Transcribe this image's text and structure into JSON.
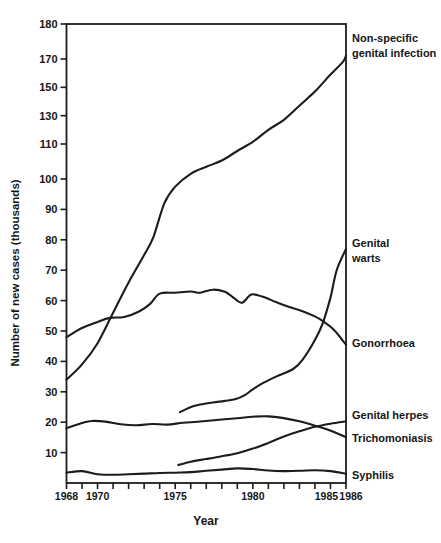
{
  "figure": {
    "background": "#ffffff",
    "line_color": "#1c1c1c",
    "text_color": "#161616"
  },
  "chart_data": {
    "type": "line",
    "title": "",
    "xlabel": "Year",
    "ylabel": "Number of new cases (thousands)",
    "x_range": [
      1968,
      1986
    ],
    "y_scale_note": "Scale compressed above 110: labeled ticks 110, 130, 150, 170, 180 drawn at equal spacing",
    "grid": "off",
    "frame": "full box",
    "y_ticks": [
      {
        "value": 180,
        "label": "180"
      },
      {
        "value": 170,
        "label": "170"
      },
      {
        "value": 150,
        "label": "150"
      },
      {
        "value": 130,
        "label": "130"
      },
      {
        "value": 110,
        "label": "110"
      },
      {
        "value": 100,
        "label": "100"
      },
      {
        "value": 90,
        "label": "90"
      },
      {
        "value": 80,
        "label": "80"
      },
      {
        "value": 70,
        "label": "70"
      },
      {
        "value": 60,
        "label": "60"
      },
      {
        "value": 50,
        "label": "50"
      },
      {
        "value": 40,
        "label": "40"
      },
      {
        "value": 30,
        "label": "30"
      },
      {
        "value": 20,
        "label": "20"
      },
      {
        "value": 10,
        "label": "10"
      }
    ],
    "x_ticks_years": [
      1968,
      1969,
      1970,
      1971,
      1972,
      1973,
      1974,
      1975,
      1976,
      1977,
      1978,
      1979,
      1980,
      1981,
      1982,
      1983,
      1984,
      1985,
      1986
    ],
    "x_tick_labels": [
      {
        "year": 1968,
        "label": "1968",
        "dx": 0
      },
      {
        "year": 1970,
        "label": "1970",
        "dx": 0
      },
      {
        "year": 1975,
        "label": "1975",
        "dx": 0
      },
      {
        "year": 1980,
        "label": "1980",
        "dx": 0
      },
      {
        "year": 1985,
        "label": "1985",
        "dx": -4
      },
      {
        "year": 1986,
        "label": "1986",
        "dx": 5
      }
    ],
    "series": [
      {
        "name": "Non-specific genital infection",
        "label_lines": [
          "Non-specific",
          "genital infection"
        ],
        "label_y": 42,
        "points": [
          [
            1968,
            34
          ],
          [
            1969,
            39
          ],
          [
            1970,
            46
          ],
          [
            1971,
            56
          ],
          [
            1972,
            66
          ],
          [
            1973,
            75
          ],
          [
            1973.6,
            81
          ],
          [
            1974.3,
            92
          ],
          [
            1975,
            97.5
          ],
          [
            1976,
            101.5
          ],
          [
            1977,
            103.5
          ],
          [
            1978,
            105.3
          ],
          [
            1979,
            108
          ],
          [
            1980,
            111.5
          ],
          [
            1981,
            120
          ],
          [
            1982,
            127
          ],
          [
            1983,
            137
          ],
          [
            1984,
            147
          ],
          [
            1984.5,
            153
          ],
          [
            1985,
            159
          ],
          [
            1985.8,
            168
          ],
          [
            1986,
            171
          ]
        ]
      },
      {
        "name": "Gonorrhoea",
        "label_lines": [
          "Gonorrhoea"
        ],
        "label_y": 347,
        "points": [
          [
            1968,
            48
          ],
          [
            1969,
            51
          ],
          [
            1970,
            53
          ],
          [
            1970.8,
            54.3
          ],
          [
            1971.7,
            54.6
          ],
          [
            1972.7,
            56.5
          ],
          [
            1973.4,
            59
          ],
          [
            1974,
            62.3
          ],
          [
            1975,
            62.6
          ],
          [
            1976,
            63
          ],
          [
            1976.6,
            62.6
          ],
          [
            1977.4,
            63.6
          ],
          [
            1978.2,
            62.9
          ],
          [
            1978.7,
            61.2
          ],
          [
            1979.3,
            59.3
          ],
          [
            1979.9,
            62
          ],
          [
            1980.6,
            61.3
          ],
          [
            1981.5,
            59.5
          ],
          [
            1982.4,
            57.8
          ],
          [
            1983.2,
            56.5
          ],
          [
            1984,
            54.8
          ],
          [
            1984.5,
            53.3
          ],
          [
            1985.2,
            50.5
          ],
          [
            1986,
            45.5
          ]
        ]
      },
      {
        "name": "Genital warts",
        "label_lines": [
          "Genital",
          "warts"
        ],
        "label_y": 247,
        "points": [
          [
            1975.3,
            23.3
          ],
          [
            1976.2,
            25.3
          ],
          [
            1977.2,
            26.3
          ],
          [
            1978.2,
            27
          ],
          [
            1978.9,
            27.6
          ],
          [
            1979.5,
            29
          ],
          [
            1980,
            30.8
          ],
          [
            1980.7,
            33
          ],
          [
            1981.5,
            35
          ],
          [
            1982.6,
            37.5
          ],
          [
            1983.2,
            40.5
          ],
          [
            1984,
            47
          ],
          [
            1984.5,
            52.5
          ],
          [
            1985,
            61
          ],
          [
            1985.4,
            70
          ],
          [
            1986,
            77
          ]
        ]
      },
      {
        "name": "Genital herpes",
        "label_lines": [
          "Genital herpes"
        ],
        "label_y": 419,
        "points": [
          [
            1975.2,
            5.9
          ],
          [
            1976,
            7
          ],
          [
            1977,
            7.9
          ],
          [
            1978,
            8.8
          ],
          [
            1979,
            9.8
          ],
          [
            1980,
            11.3
          ],
          [
            1981,
            13.2
          ],
          [
            1982,
            15.3
          ],
          [
            1983,
            17
          ],
          [
            1984,
            18.5
          ],
          [
            1985,
            19.5
          ],
          [
            1986,
            20.3
          ]
        ]
      },
      {
        "name": "Trichomoniasis",
        "label_lines": [
          "Trichomoniasis"
        ],
        "label_y": 442,
        "points": [
          [
            1968,
            18
          ],
          [
            1969,
            19.7
          ],
          [
            1969.6,
            20.4
          ],
          [
            1970.5,
            20.2
          ],
          [
            1971.5,
            19.3
          ],
          [
            1972.5,
            19
          ],
          [
            1973.5,
            19.4
          ],
          [
            1974.5,
            19.2
          ],
          [
            1975.5,
            19.8
          ],
          [
            1976.8,
            20.3
          ],
          [
            1978,
            20.9
          ],
          [
            1979,
            21.3
          ],
          [
            1980,
            21.8
          ],
          [
            1981,
            21.9
          ],
          [
            1981.9,
            21.4
          ],
          [
            1983,
            20.3
          ],
          [
            1983.9,
            19
          ],
          [
            1984.8,
            17.6
          ],
          [
            1986,
            15.1
          ]
        ]
      },
      {
        "name": "Syphilis",
        "label_lines": [
          "Syphilis"
        ],
        "label_y": 479,
        "points": [
          [
            1968,
            3.4
          ],
          [
            1969,
            3.9
          ],
          [
            1970,
            2.9
          ],
          [
            1971,
            2.7
          ],
          [
            1972,
            2.9
          ],
          [
            1973,
            3.1
          ],
          [
            1974,
            3.3
          ],
          [
            1975,
            3.4
          ],
          [
            1976,
            3.6
          ],
          [
            1977,
            4
          ],
          [
            1978,
            4.4
          ],
          [
            1979,
            4.8
          ],
          [
            1980,
            4.6
          ],
          [
            1981,
            4.1
          ],
          [
            1982,
            3.9
          ],
          [
            1983,
            4
          ],
          [
            1984,
            4.2
          ],
          [
            1985,
            3.9
          ],
          [
            1986,
            3.1
          ]
        ]
      }
    ]
  }
}
